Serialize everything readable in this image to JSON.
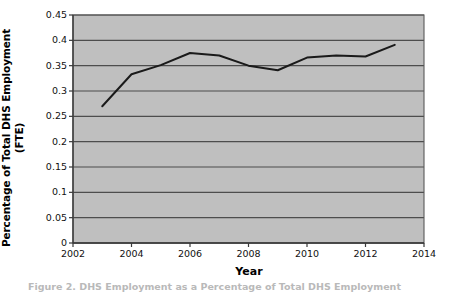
{
  "chart_data": {
    "type": "line",
    "title": "",
    "xlabel": "Year",
    "ylabel": "Percentage of Total DHS Employment (FTE)",
    "ylabel_line1": "Percentage of Total DHS Employment",
    "ylabel_line2": "(FTE)",
    "xlim": [
      2002,
      2014
    ],
    "ylim": [
      0,
      0.45
    ],
    "xticks": [
      2002,
      2004,
      2006,
      2008,
      2010,
      2012,
      2014
    ],
    "xtick_labels": [
      "2002",
      "2004",
      "2006",
      "2008",
      "2010",
      "2012",
      "2014"
    ],
    "yticks": [
      0,
      0.05,
      0.1,
      0.15,
      0.2,
      0.25,
      0.3,
      0.35,
      0.4,
      0.45
    ],
    "ytick_labels": [
      "0",
      "0.05",
      "0.1",
      "0.15",
      "0.2",
      "0.25",
      "0.3",
      "0.35",
      "0.4",
      "0.45"
    ],
    "grid": "horizontal",
    "legend": "none",
    "plot_background": "#bfbfbf",
    "line_color": "#1a1a1a",
    "gridline_color": "#4d4d4d",
    "series": [
      {
        "name": "Percentage of Total DHS Employment (FTE)",
        "x": [
          2003,
          2004,
          2005,
          2006,
          2007,
          2008,
          2009,
          2010,
          2011,
          2012,
          2013
        ],
        "values": [
          0.27,
          0.333,
          0.351,
          0.375,
          0.37,
          0.35,
          0.341,
          0.366,
          0.37,
          0.368,
          0.391
        ]
      }
    ]
  },
  "caption": {
    "text": "Figure 2.  DHS Employment as a Percentage of Total DHS Employment"
  }
}
